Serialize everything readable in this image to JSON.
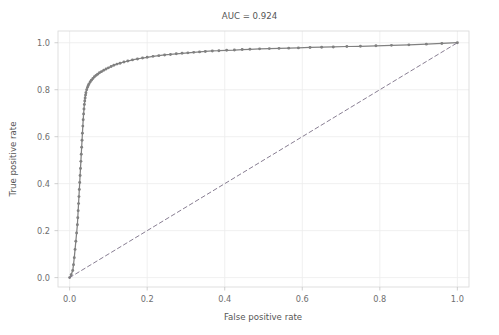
{
  "chart_data": {
    "type": "line",
    "title": "AUC = 0.924",
    "xlabel": "False positive rate",
    "ylabel": "True positive rate",
    "xlim": [
      -0.03,
      1.03
    ],
    "ylim": [
      -0.04,
      1.05
    ],
    "xticks": [
      "0.0",
      "0.2",
      "0.4",
      "0.6",
      "0.8",
      "1.0"
    ],
    "xtick_values": [
      0.0,
      0.2,
      0.4,
      0.6,
      0.8,
      1.0
    ],
    "yticks": [
      "0.0",
      "0.2",
      "0.4",
      "0.6",
      "0.8",
      "1.0"
    ],
    "ytick_values": [
      0.0,
      0.2,
      0.4,
      0.6,
      0.8,
      1.0
    ],
    "grid": true,
    "legend": "none",
    "series": [
      {
        "name": "ROC curve",
        "color": "#808080",
        "marker": "circle",
        "linestyle": "solid",
        "x": [
          0.0,
          0.004,
          0.008,
          0.01,
          0.012,
          0.014,
          0.016,
          0.018,
          0.02,
          0.021,
          0.022,
          0.023,
          0.024,
          0.025,
          0.026,
          0.027,
          0.028,
          0.029,
          0.03,
          0.031,
          0.032,
          0.033,
          0.034,
          0.035,
          0.036,
          0.037,
          0.038,
          0.039,
          0.04,
          0.041,
          0.042,
          0.044,
          0.046,
          0.048,
          0.05,
          0.053,
          0.056,
          0.06,
          0.064,
          0.068,
          0.072,
          0.077,
          0.082,
          0.088,
          0.094,
          0.1,
          0.107,
          0.114,
          0.122,
          0.13,
          0.14,
          0.15,
          0.162,
          0.175,
          0.188,
          0.2,
          0.215,
          0.23,
          0.245,
          0.26,
          0.275,
          0.29,
          0.305,
          0.32,
          0.335,
          0.35,
          0.368,
          0.385,
          0.405,
          0.425,
          0.445,
          0.465,
          0.49,
          0.515,
          0.54,
          0.565,
          0.59,
          0.62,
          0.65,
          0.68,
          0.715,
          0.75,
          0.79,
          0.83,
          0.875,
          0.92,
          0.96,
          1.0
        ],
        "y": [
          0.0,
          0.012,
          0.03,
          0.055,
          0.085,
          0.12,
          0.155,
          0.19,
          0.225,
          0.255,
          0.285,
          0.315,
          0.345,
          0.375,
          0.405,
          0.435,
          0.465,
          0.495,
          0.525,
          0.555,
          0.585,
          0.615,
          0.645,
          0.672,
          0.697,
          0.718,
          0.737,
          0.752,
          0.765,
          0.777,
          0.787,
          0.8,
          0.81,
          0.818,
          0.825,
          0.833,
          0.84,
          0.848,
          0.855,
          0.861,
          0.866,
          0.872,
          0.877,
          0.883,
          0.888,
          0.893,
          0.899,
          0.904,
          0.909,
          0.913,
          0.918,
          0.922,
          0.927,
          0.931,
          0.935,
          0.938,
          0.942,
          0.945,
          0.948,
          0.95,
          0.953,
          0.955,
          0.957,
          0.959,
          0.961,
          0.963,
          0.965,
          0.966,
          0.968,
          0.969,
          0.971,
          0.972,
          0.974,
          0.975,
          0.976,
          0.977,
          0.978,
          0.98,
          0.981,
          0.982,
          0.984,
          0.985,
          0.987,
          0.989,
          0.991,
          0.994,
          0.997,
          1.0
        ]
      },
      {
        "name": "chance diagonal",
        "color": "#7a6f86",
        "marker": "none",
        "linestyle": "dashed",
        "x": [
          0.0,
          1.0
        ],
        "y": [
          0.0,
          1.0
        ]
      }
    ]
  }
}
